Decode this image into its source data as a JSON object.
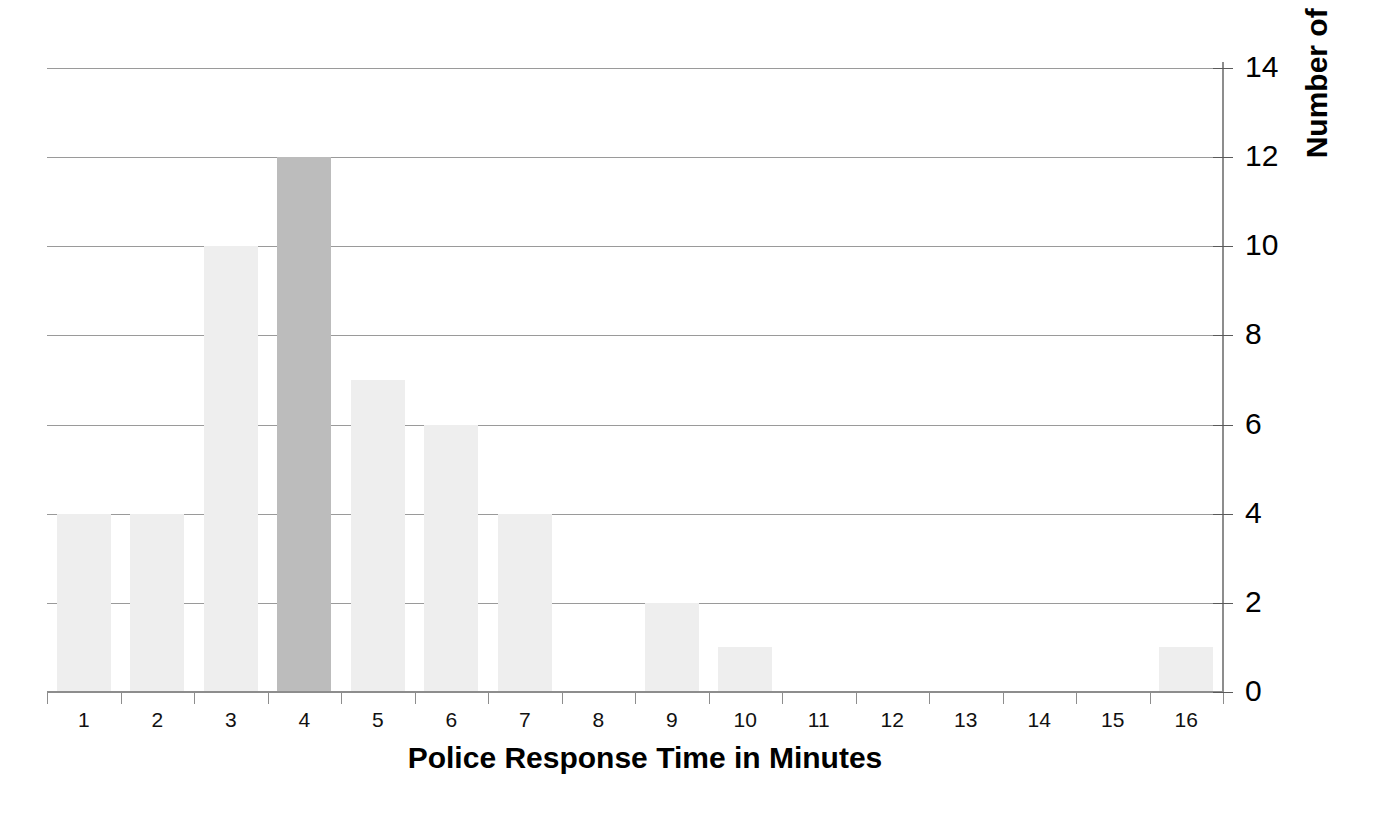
{
  "chart_data": {
    "type": "bar",
    "title": "",
    "xlabel": "Police Response Time in Minutes",
    "ylabel": "Number of Events",
    "categories": [
      "1",
      "2",
      "3",
      "4",
      "5",
      "6",
      "7",
      "8",
      "9",
      "10",
      "11",
      "12",
      "13",
      "14",
      "15",
      "16"
    ],
    "values": [
      4,
      4,
      10,
      12,
      7,
      6,
      4,
      0,
      2,
      1,
      0,
      0,
      0,
      0,
      0,
      1
    ],
    "highlight_index": 3,
    "ylim": [
      0,
      14
    ],
    "y_ticks": [
      "0",
      "2",
      "4",
      "6",
      "8",
      "10",
      "12",
      "14"
    ],
    "y_tick_values": [
      0,
      2,
      4,
      6,
      8,
      10,
      12,
      14
    ],
    "grid": "horizontal",
    "legend": "none",
    "y_axis_position": "right",
    "colors": {
      "bar_default": "#eeeeee",
      "bar_highlight": "#bcbcbc",
      "gridline": "#9a9a9a",
      "axis": "#8d8d8d",
      "text": "#000000",
      "background": "#ffffff"
    }
  }
}
